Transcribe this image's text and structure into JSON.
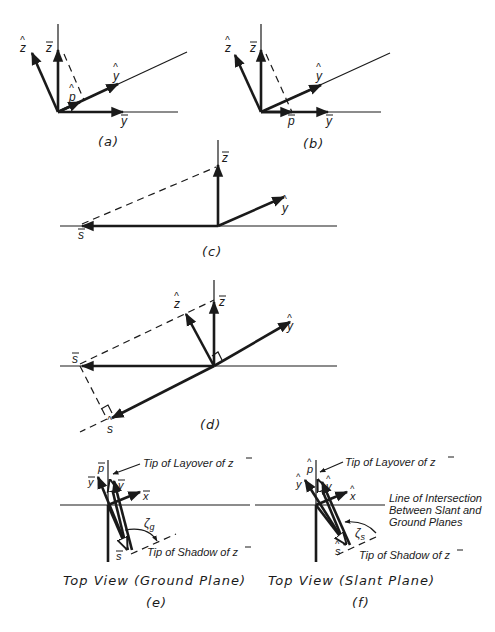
{
  "figure": {
    "colors": {
      "ink": "#1a1a1a",
      "background": "#ffffff"
    },
    "panels": [
      {
        "id": "a",
        "caption": "(a)",
        "vectors": [
          "z-hat",
          "z-bar",
          "y-hat",
          "p-hat",
          "y-bar"
        ],
        "labels": {
          "z_hat": "z",
          "z_bar": "z",
          "y_hat": "y",
          "p_hat": "p",
          "y_bar": "y"
        }
      },
      {
        "id": "b",
        "caption": "(b)",
        "vectors": [
          "z-hat",
          "z-bar",
          "y-hat",
          "p-bar",
          "y-bar"
        ],
        "labels": {
          "z_hat": "z",
          "z_bar": "z",
          "y_hat": "y",
          "p_bar": "p",
          "y_bar": "y"
        }
      },
      {
        "id": "c",
        "caption": "(c)",
        "vectors": [
          "z-bar",
          "y-hat",
          "s-bar"
        ],
        "labels": {
          "z_bar": "z",
          "y_hat": "y",
          "s_bar": "s"
        }
      },
      {
        "id": "d",
        "caption": "(d)",
        "vectors": [
          "z-hat",
          "z-bar",
          "y-hat",
          "s-bar",
          "s-hat"
        ],
        "labels": {
          "z_hat": "z",
          "z_bar": "z",
          "y_hat": "y",
          "s_bar": "s",
          "s_hat": "s"
        }
      },
      {
        "id": "e",
        "title": "Top View (Ground Plane)",
        "caption": "(e)",
        "labels": {
          "p_bar": "p",
          "y_bar": "y",
          "v_bar": "v",
          "x_bar": "x",
          "s_bar": "s",
          "zeta": "ζ",
          "zeta_sub": "g",
          "layover_note": "Tip of Layover of ",
          "layover_var": "z",
          "shadow_note": "Tip of Shadow of ",
          "shadow_var": "z"
        }
      },
      {
        "id": "f",
        "title": "Top View (Slant Plane)",
        "caption": "(f)",
        "labels": {
          "p_hat": "p",
          "y_hat": "y",
          "v_hat": "v",
          "x_hat": "x",
          "s_hat": "s",
          "zeta": "ζ",
          "zeta_sub": "s",
          "layover_note": "Tip of Layover of ",
          "layover_var": "z",
          "shadow_note": "Tip of Shadow of ",
          "shadow_var": "z",
          "intersection_note": [
            "Line of Intersection",
            "Between Slant and",
            "Ground Planes"
          ]
        }
      }
    ]
  }
}
